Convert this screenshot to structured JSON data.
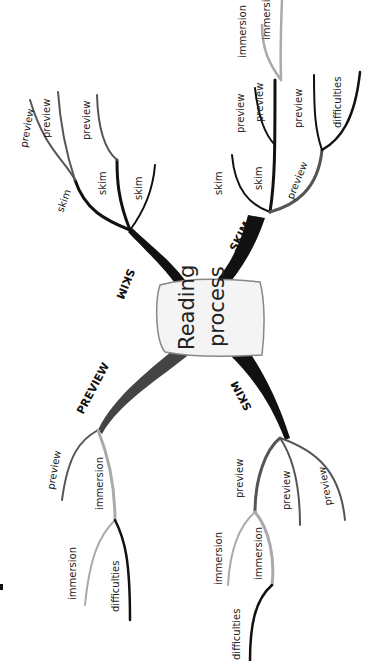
{
  "diagram": {
    "type": "mind-map",
    "orientation": "rotated-90-ccw",
    "center": {
      "line1": "Reading",
      "line2": "process"
    },
    "branches": [
      {
        "label": "SKIM",
        "children": [
          {
            "label": "skim",
            "children": [
              {
                "label": "preview"
              },
              {
                "label": "preview"
              }
            ]
          },
          {
            "label": "skim",
            "children": [
              {
                "label": "preview"
              }
            ]
          },
          {
            "label": "skim"
          }
        ]
      },
      {
        "label": "SKIM",
        "children": [
          {
            "label": "skim"
          },
          {
            "label": "skim",
            "children": [
              {
                "label": "preview"
              },
              {
                "label": "preview",
                "children": [
                  {
                    "label": "immersion"
                  },
                  {
                    "label": "immersion"
                  }
                ]
              }
            ]
          },
          {
            "label": "preview",
            "children": [
              {
                "label": "preview"
              },
              {
                "label": "difficulties"
              }
            ]
          }
        ]
      },
      {
        "label": "PREVIEW",
        "children": [
          {
            "label": "preview"
          },
          {
            "label": "immersion",
            "children": [
              {
                "label": "immersion"
              },
              {
                "label": "difficulties"
              }
            ]
          }
        ]
      },
      {
        "label": "SKIM",
        "children": [
          {
            "label": "preview",
            "children": [
              {
                "label": "immersion"
              },
              {
                "label": "immersion",
                "children": [
                  {
                    "label": "difficulties"
                  }
                ]
              }
            ]
          },
          {
            "label": "preview"
          },
          {
            "label": "preview"
          }
        ]
      }
    ]
  },
  "labels": {
    "center1": "Reading",
    "center2": "process",
    "b1": "SKIM",
    "b1s1": "skim",
    "b1s2": "skim",
    "b1s3": "skim",
    "b1p1": "preview",
    "b1p2": "preview",
    "b1p3": "preview",
    "b2": "SKIM",
    "b2s1": "skim",
    "b2s2": "skim",
    "b2pv": "preview",
    "b2p1": "preview",
    "b2p2": "preview",
    "b2i1": "immersion",
    "b2i2": "immersion",
    "b2p3": "preview",
    "b2d": "difficulties",
    "b3": "PREVIEW",
    "b3p": "preview",
    "b3i": "immersion",
    "b3i2": "immersion",
    "b3d": "difficulties",
    "b4": "SKIM",
    "b4p1": "preview",
    "b4p2": "preview",
    "b4p3": "preview",
    "b4i1": "immersion",
    "b4i2": "immersion",
    "b4d": "difficulties"
  },
  "colors": {
    "black": "#111111",
    "dark_gray": "#555555",
    "light_gray": "#aaaaaa"
  }
}
